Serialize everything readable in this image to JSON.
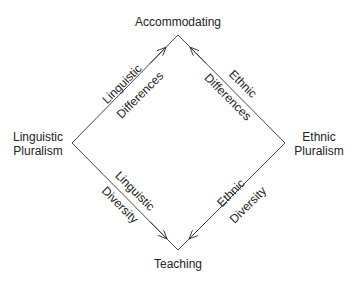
{
  "nodes": {
    "top": "Accommodating",
    "left_line1": "Linguistic",
    "left_line2": "Pluralism",
    "right_line1": "Ethnic",
    "right_line2": "Pluralism",
    "bottom": "Teaching"
  },
  "edges": {
    "upper_left": {
      "outer": "Linguistic",
      "inner": "Differences"
    },
    "upper_right": {
      "outer": "Ethnic",
      "inner": "Differences"
    },
    "lower_left": {
      "outer": "Diversity",
      "inner": "Linguistic"
    },
    "lower_right": {
      "outer": "Diversity",
      "inner": "Ethnic"
    }
  }
}
